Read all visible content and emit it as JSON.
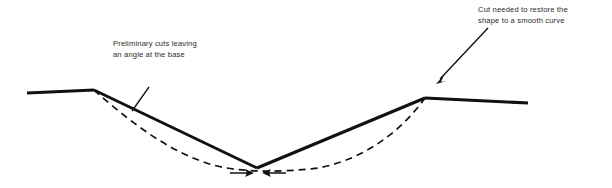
{
  "figure": {
    "background_color": "#ffffff",
    "stroke_color": "#111111",
    "text_color": "#2b2b2b",
    "width": 612,
    "height": 188
  },
  "annotations": {
    "left": {
      "name": "preliminary-cuts-note",
      "line1": "Preliminary cuts leaving",
      "line2": "an angle at the base"
    },
    "right": {
      "name": "restoring-cut-note",
      "line1": "Cut needed to restore the",
      "line2": "shape to a smooth curve"
    }
  },
  "chart_data": {
    "type": "line",
    "title": "Preliminary cuts leaving an angle at the base",
    "xlabel": "",
    "ylabel": "",
    "xlim": [
      0,
      612
    ],
    "ylim": [
      188,
      0
    ],
    "grid": false,
    "legend": "none",
    "series": [
      {
        "name": "solid-profile-left-flat",
        "style": "solid",
        "width": 3,
        "points": [
          [
            27,
            93
          ],
          [
            94,
            90
          ]
        ]
      },
      {
        "name": "solid-profile-left-bevel",
        "style": "solid",
        "width": 3,
        "points": [
          [
            94,
            90
          ],
          [
            257,
            168
          ]
        ]
      },
      {
        "name": "solid-profile-right-bevel",
        "style": "solid",
        "width": 3,
        "points": [
          [
            257,
            168
          ],
          [
            425,
            98
          ]
        ]
      },
      {
        "name": "solid-profile-right-flat",
        "style": "solid",
        "width": 3,
        "points": [
          [
            425,
            98
          ],
          [
            528,
            103
          ]
        ]
      },
      {
        "name": "dashed-smooth-curve",
        "style": "dashed",
        "width": 1.6,
        "dash": [
          7,
          5
        ],
        "points": [
          [
            94,
            90
          ],
          [
            150,
            130
          ],
          [
            200,
            158
          ],
          [
            257,
            173
          ],
          [
            320,
            170
          ],
          [
            375,
            146
          ],
          [
            425,
            98
          ]
        ]
      }
    ],
    "annotations": [
      {
        "name": "leader-line-left",
        "type": "line",
        "points": [
          [
            149,
            87
          ],
          [
            132,
            111
          ]
        ]
      },
      {
        "name": "arrow-right-label",
        "type": "arrow",
        "points": [
          [
            487,
            28
          ],
          [
            437,
            83
          ]
        ],
        "arrowhead": "end"
      },
      {
        "name": "arrow-base-left",
        "type": "arrow",
        "points": [
          [
            228,
            173
          ],
          [
            253,
            173
          ]
        ],
        "arrowhead": "end"
      },
      {
        "name": "arrow-base-right",
        "type": "arrow",
        "points": [
          [
            288,
            173
          ],
          [
            262,
            173
          ]
        ],
        "arrowhead": "end"
      }
    ]
  }
}
